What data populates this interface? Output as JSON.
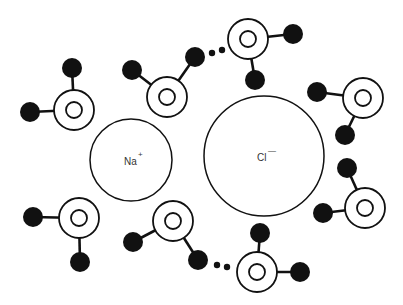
{
  "colors": {
    "background": "#ffffff",
    "stroke": "#111111",
    "hydrogen_fill": "#111111",
    "label": "#333333"
  },
  "ions": [
    {
      "id": "sodium",
      "symbol": "Na",
      "charge": "+",
      "cx": 131,
      "cy": 160,
      "r": 41
    },
    {
      "id": "chloride",
      "symbol": "Cl",
      "charge": "—",
      "cx": 264,
      "cy": 156,
      "r": 60
    }
  ],
  "water_molecules": [
    {
      "id": "w1",
      "oxygen": {
        "cx": 74,
        "cy": 110
      },
      "hydrogens": [
        {
          "cx": 72,
          "cy": 68
        },
        {
          "cx": 30,
          "cy": 112
        }
      ]
    },
    {
      "id": "w2",
      "oxygen": {
        "cx": 167,
        "cy": 97
      },
      "hydrogens": [
        {
          "cx": 132,
          "cy": 70
        },
        {
          "cx": 195,
          "cy": 57
        }
      ]
    },
    {
      "id": "w3",
      "oxygen": {
        "cx": 248,
        "cy": 39
      },
      "hydrogens": [
        {
          "cx": 293,
          "cy": 34
        },
        {
          "cx": 255,
          "cy": 80
        }
      ]
    },
    {
      "id": "w4",
      "oxygen": {
        "cx": 363,
        "cy": 98
      },
      "hydrogens": [
        {
          "cx": 317,
          "cy": 92
        },
        {
          "cx": 345,
          "cy": 135
        }
      ]
    },
    {
      "id": "w5",
      "oxygen": {
        "cx": 365,
        "cy": 208
      },
      "hydrogens": [
        {
          "cx": 347,
          "cy": 168
        },
        {
          "cx": 323,
          "cy": 213
        }
      ]
    },
    {
      "id": "w6",
      "oxygen": {
        "cx": 79,
        "cy": 218
      },
      "hydrogens": [
        {
          "cx": 33,
          "cy": 217
        },
        {
          "cx": 80,
          "cy": 262
        }
      ]
    },
    {
      "id": "w7",
      "oxygen": {
        "cx": 173,
        "cy": 221
      },
      "hydrogens": [
        {
          "cx": 133,
          "cy": 242
        },
        {
          "cx": 198,
          "cy": 260
        }
      ]
    },
    {
      "id": "w8",
      "oxygen": {
        "cx": 257,
        "cy": 272
      },
      "hydrogens": [
        {
          "cx": 260,
          "cy": 233
        },
        {
          "cx": 300,
          "cy": 272
        }
      ]
    }
  ],
  "hydrogen_bonds": [
    {
      "id": "hb1",
      "dots": [
        {
          "cx": 212,
          "cy": 53
        },
        {
          "cx": 222,
          "cy": 50
        }
      ]
    },
    {
      "id": "hb2",
      "dots": [
        {
          "cx": 217,
          "cy": 265
        },
        {
          "cx": 227,
          "cy": 267
        }
      ]
    }
  ],
  "geometry": {
    "oxygen_outer_r": 20,
    "oxygen_inner_r": 8,
    "hydrogen_r": 10,
    "dot_r": 3.2
  }
}
